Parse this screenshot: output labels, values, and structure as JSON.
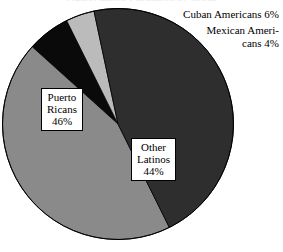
{
  "title_remnant": "Figure: Latino Population by Group",
  "chart_data": {
    "type": "pie",
    "title": "",
    "subtitle": "",
    "xlabel": "",
    "ylabel": "",
    "legend_position": "none",
    "grid": false,
    "units": "percent",
    "total": 100,
    "categories": [
      "Puerto Ricans",
      "Other Latinos",
      "Cuban Americans",
      "Mexican Americans"
    ],
    "values": [
      46,
      44,
      6,
      4
    ],
    "slices": [
      {
        "name": "Puerto Ricans",
        "value": 46,
        "value_text": "46%",
        "color": "#2e2e2e",
        "label_lines": [
          "Puerto",
          "Ricans",
          "46%"
        ],
        "label_style": "boxed-on-slice",
        "start_angle": 168,
        "end_angle": 333.6
      },
      {
        "name": "Other Latinos",
        "value": 44,
        "value_text": "44%",
        "color": "#8a8a8a",
        "label_lines": [
          "Other",
          "Latinos",
          "44%"
        ],
        "label_style": "boxed-on-slice",
        "start_angle": 9.6,
        "end_angle": 168
      },
      {
        "name": "Cuban Americans",
        "value": 6,
        "value_text": "6%",
        "color": "#0a0a0a",
        "label_lines": [
          "Cuban Americans 6%"
        ],
        "label_style": "callout-right",
        "start_angle": 333.6,
        "end_angle": 375.2
      },
      {
        "name": "Mexican Americans",
        "value": 4,
        "value_text": "4%",
        "color": "#bbbbbb",
        "label_lines": [
          "Mexican Ameri-",
          "cans 4%"
        ],
        "label_style": "callout-right",
        "start_angle": 375.2,
        "end_angle": 398.0
      }
    ]
  },
  "labels": {
    "puerto_ricans": {
      "line1": "Puerto",
      "line2": "Ricans",
      "line3": "46%"
    },
    "other_latinos": {
      "line1": "Other",
      "line2": "Latinos",
      "line3": "44%"
    },
    "cuban_americans": {
      "text": "Cuban Americans 6%"
    },
    "mexican_americans": {
      "line1": "Mexican Ameri-",
      "line2": "cans 4%"
    }
  },
  "colors": {
    "puerto_ricans": "#2e2e2e",
    "other_latinos": "#8a8a8a",
    "cuban_americans": "#0a0a0a",
    "mexican_americans": "#bbbbbb",
    "outline": "#000000",
    "background": "#ffffff"
  }
}
